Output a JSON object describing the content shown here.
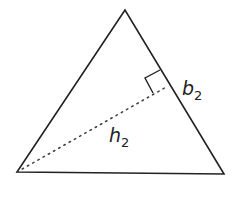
{
  "diagram": {
    "type": "triangle-altitude",
    "stroke_color": "#222222",
    "vertices": {
      "top": [
        125,
        10
      ],
      "bottom_left": [
        17,
        172
      ],
      "bottom_right": [
        224,
        174
      ]
    },
    "altitude_foot": [
      168,
      86
    ],
    "labels": {
      "base": {
        "main": "b",
        "sub": "2"
      },
      "height": {
        "main": "h",
        "sub": "2"
      }
    }
  }
}
